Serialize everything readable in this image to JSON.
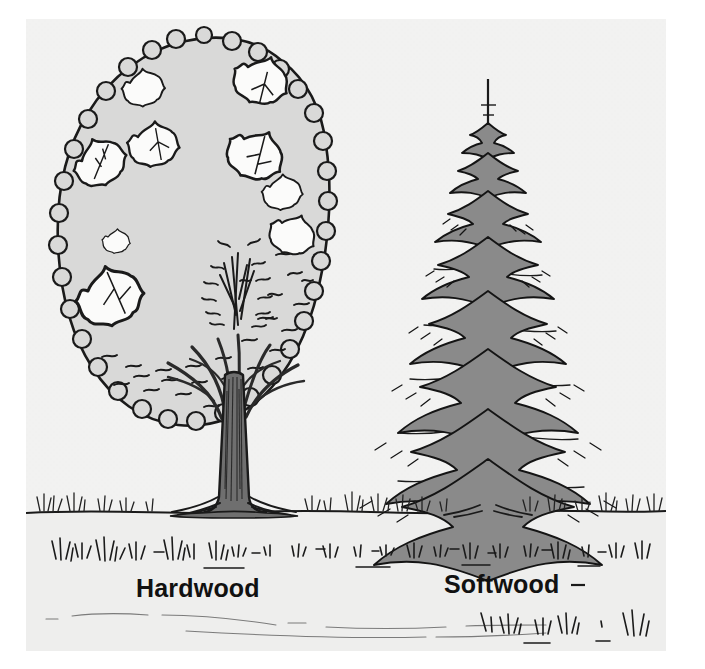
{
  "figure": {
    "kind": "botanical-comparison-illustration",
    "style": "black-ink line drawing with flat gray tones",
    "panel_background": "#f2f2f1",
    "page_background": "#ffffff",
    "ink_color": "#1a1a1a"
  },
  "labels": {
    "hardwood": "Hardwood",
    "softwood": "Softwood"
  },
  "subjects": [
    {
      "id": "hardwood-tree",
      "label": "Hardwood",
      "common_form": "broadleaf deciduous tree",
      "crown_shape": "rounded ovoid",
      "crown_fill": "#d9d9d8",
      "crown_outline": "#1a1a1a",
      "leaf_cutouts": 9,
      "trunk_fill": "#6f6f6f",
      "trunk_outline": "#1a1a1a",
      "trunk_description": "single straight bole flaring into buttress roots, branching into upright limbs"
    },
    {
      "id": "softwood-tree",
      "label": "Softwood",
      "common_form": "needle-leaf coniferous tree",
      "crown_shape": "narrow conical spire",
      "foliage_fill": "#8a8a8a",
      "foliage_outline": "#141414",
      "branch_tiers": 11,
      "leader_spike": true,
      "trunk_fill": "#5f5f5f",
      "trunk_description": "slender straight central leader with whorled drooping branch tiers"
    }
  ],
  "scene": {
    "horizon_y_ratio": 0.78,
    "ground_tone": "#eeeeed",
    "grass_tufts_on_horizon": 26,
    "grass_tufts_foreground": 22,
    "foreground_path": "faint curving trail lines"
  }
}
